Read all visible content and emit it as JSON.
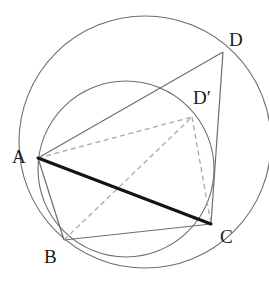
{
  "figure": {
    "width": 269,
    "height": 283,
    "background_color": "#ffffff"
  },
  "colors": {
    "circle_stroke": "#6e6e70",
    "thin_line": "#6e6e70",
    "emphasis_line": "#141414",
    "dashed_line": "#a9a9ad",
    "label_text": "#1a1a1a"
  },
  "circles": [
    {
      "name": "large-circle",
      "cx": 145,
      "cy": 142,
      "r": 126,
      "stroke": "#6e6e70",
      "stroke_width": 1.1
    },
    {
      "name": "small-circle",
      "cx": 126,
      "cy": 169,
      "r": 88,
      "stroke": "#6e6e70",
      "stroke_width": 1.1
    }
  ],
  "points": [
    {
      "id": "A",
      "label": "A",
      "x": 38,
      "y": 158,
      "label_x": 12,
      "label_y": 147
    },
    {
      "id": "B",
      "label": "B",
      "x": 64,
      "y": 240,
      "label_x": 44,
      "label_y": 247
    },
    {
      "id": "C",
      "label": "C",
      "x": 211,
      "y": 224,
      "label_x": 220,
      "label_y": 227
    },
    {
      "id": "D",
      "label": "D",
      "x": 223,
      "y": 52,
      "label_x": 229,
      "label_y": 30
    },
    {
      "id": "Dp",
      "label": "D′",
      "x": 192,
      "y": 117,
      "label_x": 193,
      "label_y": 88
    }
  ],
  "segments": [
    {
      "name": "segment-A-D",
      "from": "A",
      "to": "D",
      "style": "solid",
      "stroke": "#6e6e70",
      "stroke_width": 1.2,
      "x1": 38,
      "y1": 158,
      "x2": 223,
      "y2": 52
    },
    {
      "name": "segment-D-C",
      "from": "D",
      "to": "C",
      "style": "solid",
      "stroke": "#6e6e70",
      "stroke_width": 1.2,
      "x1": 223,
      "y1": 52,
      "x2": 211,
      "y2": 224
    },
    {
      "name": "segment-A-C",
      "from": "A",
      "to": "C",
      "style": "solid",
      "stroke": "#141414",
      "stroke_width": 3.0,
      "x1": 38,
      "y1": 158,
      "x2": 211,
      "y2": 224
    },
    {
      "name": "segment-A-B",
      "from": "A",
      "to": "B",
      "style": "solid",
      "stroke": "#6e6e70",
      "stroke_width": 1.2,
      "x1": 38,
      "y1": 158,
      "x2": 64,
      "y2": 240
    },
    {
      "name": "segment-B-C",
      "from": "B",
      "to": "C",
      "style": "solid",
      "stroke": "#6e6e70",
      "stroke_width": 1.2,
      "x1": 64,
      "y1": 240,
      "x2": 211,
      "y2": 224
    },
    {
      "name": "segment-A-Dprime",
      "from": "A",
      "to": "Dp",
      "style": "dashed",
      "stroke": "#a9a9ad",
      "stroke_width": 1.3,
      "x1": 38,
      "y1": 158,
      "x2": 192,
      "y2": 117
    },
    {
      "name": "segment-Dprime-C",
      "from": "Dp",
      "to": "C",
      "style": "dashed",
      "stroke": "#a9a9ad",
      "stroke_width": 1.3,
      "x1": 192,
      "y1": 117,
      "x2": 211,
      "y2": 224
    },
    {
      "name": "segment-B-Dprime",
      "from": "B",
      "to": "Dp",
      "style": "dashed",
      "stroke": "#a9a9ad",
      "stroke_width": 1.3,
      "x1": 64,
      "y1": 240,
      "x2": 192,
      "y2": 117
    }
  ],
  "labels": {
    "A": "A",
    "B": "B",
    "C": "C",
    "D": "D",
    "Dprime": "D′"
  }
}
